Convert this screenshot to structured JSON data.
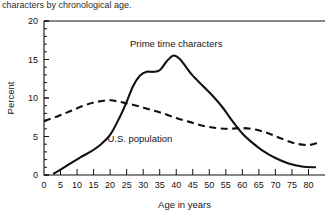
{
  "caption": "characters by chronological age.",
  "chart_data": {
    "type": "line",
    "title": "",
    "xlabel": "Age in years",
    "ylabel": "Percent",
    "xlim": [
      0,
      85
    ],
    "ylim": [
      0,
      20
    ],
    "xticks": [
      0,
      5,
      10,
      15,
      20,
      25,
      30,
      35,
      40,
      45,
      50,
      55,
      60,
      65,
      70,
      75,
      80
    ],
    "yticks": [
      0,
      5,
      10,
      15,
      20
    ],
    "xticklabels": [
      "0",
      "5",
      "10",
      "15",
      "20",
      "25",
      "30",
      "35",
      "40",
      "45",
      "50",
      "55",
      "60",
      "65",
      "70",
      "75",
      "80"
    ],
    "yticklabels": [
      "0",
      "5",
      "10",
      "15",
      "20"
    ],
    "grid": false,
    "legend_position": "inline-annotations",
    "annotations": [
      {
        "text": "Prime time characters",
        "x": 40,
        "y": 16.6,
        "series": "prime_time"
      },
      {
        "text": "U.S. population",
        "x": 29,
        "y": 4.3,
        "series": "us_population"
      }
    ],
    "series": [
      {
        "name": "Prime time characters",
        "style": "solid",
        "x": [
          3,
          5,
          8,
          11,
          14,
          17,
          20,
          23,
          25,
          27,
          29,
          31,
          33,
          35,
          37,
          39,
          41,
          43,
          45,
          48,
          51,
          54,
          57,
          60,
          63,
          66,
          70,
          74,
          78,
          82
        ],
        "values": [
          0.2,
          0.7,
          1.5,
          2.3,
          3.0,
          3.9,
          5.2,
          7.6,
          9.5,
          11.6,
          12.9,
          13.4,
          13.4,
          13.6,
          14.7,
          15.5,
          15.1,
          14.0,
          12.9,
          11.6,
          10.3,
          8.8,
          7.0,
          5.4,
          4.2,
          3.2,
          2.2,
          1.5,
          1.1,
          1.0
        ]
      },
      {
        "name": "U.S. population",
        "style": "dashed",
        "x": [
          0,
          4,
          8,
          12,
          16,
          20,
          24,
          28,
          32,
          36,
          40,
          44,
          48,
          52,
          56,
          60,
          64,
          68,
          72,
          76,
          80,
          83
        ],
        "values": [
          7.0,
          7.6,
          8.3,
          9.0,
          9.5,
          9.7,
          9.4,
          9.0,
          8.5,
          8.0,
          7.4,
          6.9,
          6.4,
          6.1,
          6.0,
          6.1,
          5.9,
          5.4,
          4.7,
          4.1,
          3.9,
          4.2
        ]
      }
    ]
  }
}
